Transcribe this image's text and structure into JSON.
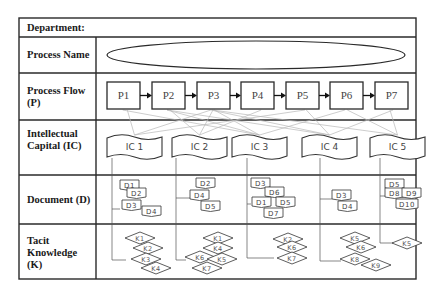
{
  "table": {
    "department_label": "Department:",
    "rows": [
      {
        "id": "process-name",
        "label": "Process Name"
      },
      {
        "id": "process-flow",
        "label": "Process Flow\n(P)"
      },
      {
        "id": "intellectual-capital",
        "label": "Intellectual\nCapital (IC)"
      },
      {
        "id": "document",
        "label": "Document (D)"
      },
      {
        "id": "tacit-knowledge",
        "label": "Tacit\nKnowledge\n(K)"
      }
    ]
  },
  "process_name": {
    "value": ""
  },
  "processes": [
    {
      "label": "P1",
      "x": 107
    },
    {
      "label": "P2",
      "x": 152
    },
    {
      "label": "P3",
      "x": 197
    },
    {
      "label": "P4",
      "x": 241
    },
    {
      "label": "P5",
      "x": 286
    },
    {
      "label": "P6",
      "x": 330
    },
    {
      "label": "P7",
      "x": 375
    }
  ],
  "intellectual_capital": [
    {
      "label": "IC 1",
      "x": 107,
      "w": 55,
      "stem_x": 112,
      "documents": [
        {
          "label": "D1",
          "x": 120,
          "y": 180
        },
        {
          "label": "D2",
          "x": 127,
          "y": 188
        },
        {
          "label": "D3",
          "x": 122,
          "y": 200
        },
        {
          "label": "D4",
          "x": 142,
          "y": 206
        }
      ],
      "doc_link_y": 209,
      "knowledge": [
        {
          "label": "K1",
          "cx": 140,
          "cy": 238
        },
        {
          "label": "K2",
          "cx": 148,
          "cy": 248
        },
        {
          "label": "K3",
          "cx": 146,
          "cy": 259
        },
        {
          "label": "K4",
          "cx": 156,
          "cy": 268
        }
      ],
      "k_link_y": 260
    },
    {
      "label": "IC 2",
      "x": 172,
      "w": 55,
      "stem_x": 176,
      "documents": [
        {
          "label": "D2",
          "x": 196,
          "y": 178
        },
        {
          "label": "D4",
          "x": 190,
          "y": 190
        },
        {
          "label": "D5",
          "x": 201,
          "y": 201
        }
      ],
      "doc_link_y": 198,
      "knowledge": [
        {
          "label": "K1",
          "cx": 218,
          "cy": 238
        },
        {
          "label": "K4",
          "cx": 218,
          "cy": 248
        },
        {
          "label": "K6",
          "cx": 200,
          "cy": 257
        },
        {
          "label": "K5",
          "cx": 222,
          "cy": 259
        },
        {
          "label": "K7",
          "cx": 207,
          "cy": 268
        }
      ],
      "k_link_y": 260
    },
    {
      "label": "IC 3",
      "x": 232,
      "w": 55,
      "stem_x": 247,
      "documents": [
        {
          "label": "D3",
          "x": 251,
          "y": 178
        },
        {
          "label": "D6",
          "x": 265,
          "y": 187
        },
        {
          "label": "D1",
          "x": 252,
          "y": 197
        },
        {
          "label": "D5",
          "x": 276,
          "y": 197
        },
        {
          "label": "D7",
          "x": 264,
          "y": 208
        }
      ],
      "doc_link_y": 204,
      "knowledge": [
        {
          "label": "K2",
          "cx": 288,
          "cy": 239
        },
        {
          "label": "K6",
          "cx": 292,
          "cy": 247
        },
        {
          "label": "K7",
          "cx": 292,
          "cy": 258
        }
      ],
      "k_link_y": 258
    },
    {
      "label": "IC 4",
      "x": 302,
      "w": 55,
      "stem_x": 320,
      "documents": [
        {
          "label": "D3",
          "x": 332,
          "y": 190
        },
        {
          "label": "D4",
          "x": 338,
          "y": 201
        }
      ],
      "doc_link_y": 199,
      "knowledge": [
        {
          "label": "K5",
          "cx": 355,
          "cy": 238
        },
        {
          "label": "K6",
          "cx": 361,
          "cy": 247
        },
        {
          "label": "K8",
          "cx": 355,
          "cy": 259
        },
        {
          "label": "K9",
          "cx": 376,
          "cy": 265
        }
      ],
      "k_link_y": 261
    },
    {
      "label": "IC 5",
      "x": 370,
      "w": 55,
      "stem_x": 380,
      "documents": [
        {
          "label": "D5",
          "x": 385,
          "y": 179
        },
        {
          "label": "D8",
          "x": 385,
          "y": 188
        },
        {
          "label": "D9",
          "x": 402,
          "y": 188
        },
        {
          "label": "D10",
          "x": 396,
          "y": 199
        }
      ],
      "doc_link_y": 196,
      "knowledge": [
        {
          "label": "K5",
          "cx": 407,
          "cy": 243
        }
      ],
      "k_link_y": 243
    }
  ],
  "ic_to_process_links": [
    [
      "IC 1",
      "P1"
    ],
    [
      "IC 1",
      "P3"
    ],
    [
      "IC 1",
      "P5"
    ],
    [
      "IC 2",
      "P2"
    ],
    [
      "IC 2",
      "P3"
    ],
    [
      "IC 2",
      "P4"
    ],
    [
      "IC 3",
      "P3"
    ],
    [
      "IC 3",
      "P1"
    ],
    [
      "IC 3",
      "P6"
    ],
    [
      "IC 3",
      "P2"
    ],
    [
      "IC 4",
      "P3"
    ],
    [
      "IC 4",
      "P5"
    ],
    [
      "IC 4",
      "P7"
    ],
    [
      "IC 4",
      "P2"
    ],
    [
      "IC 5",
      "P3"
    ],
    [
      "IC 5",
      "P6"
    ],
    [
      "IC 5",
      "P7"
    ]
  ],
  "colors": {
    "border": "#2a2a2a",
    "shape_stroke": "#333333",
    "link": "#b8b8b8",
    "text": "#444444"
  }
}
